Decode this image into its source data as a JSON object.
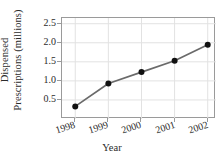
{
  "chart_data": {
    "type": "line",
    "title": "",
    "xlabel": "Year",
    "ylabel_lines": [
      "Dispensed",
      "Prescriptions (millions)"
    ],
    "ylabel": "Dispensed Prescriptions (millions)",
    "categories": [
      "1998",
      "1999",
      "2000",
      "2001",
      "2002"
    ],
    "x": [
      1998,
      1999,
      2000,
      2001,
      2002
    ],
    "values": [
      0.33,
      0.93,
      1.23,
      1.53,
      1.95
    ],
    "series": [
      {
        "name": "Dispensed Prescriptions",
        "values": [
          0.33,
          0.93,
          1.23,
          1.53,
          1.95
        ]
      }
    ],
    "xticklabels": [
      "1998",
      "1999",
      "2000",
      "2001",
      "2002"
    ],
    "yticks": [
      0.5,
      1.0,
      1.5,
      2.0,
      2.5
    ],
    "yticklabels": [
      "0.5",
      "1.0",
      "1.5",
      "2.0",
      "2.5"
    ],
    "ylim": [
      0.0,
      2.65
    ],
    "xlim": [
      1997.6,
      2002.25
    ],
    "grid": true,
    "legend": "none",
    "line_color": "#6a6a6a",
    "marker_color": "#111111",
    "grid_color": "#e2e2e2",
    "frame_color": "#9a9a9a"
  }
}
